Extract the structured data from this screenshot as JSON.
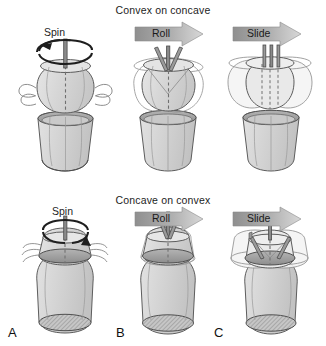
{
  "figure": {
    "kind": "arthrokinematics-diagram",
    "width": 326,
    "height": 346,
    "rows": [
      {
        "id": "convex-on-concave",
        "title": "Convex on concave",
        "panels": [
          {
            "letter": "A",
            "motion": "Spin",
            "motion_type": "rotation-arrow"
          },
          {
            "letter": "B",
            "motion": "Roll",
            "motion_type": "block-arrow-right"
          },
          {
            "letter": "C",
            "motion": "Slide",
            "motion_type": "block-arrow-right"
          }
        ]
      },
      {
        "id": "concave-on-convex",
        "title": "Concave on convex",
        "panels": [
          {
            "letter": "A",
            "motion": "Spin",
            "motion_type": "rotation-arrow"
          },
          {
            "letter": "B",
            "motion": "Roll",
            "motion_type": "block-arrow-right"
          },
          {
            "letter": "C",
            "motion": "Slide",
            "motion_type": "block-arrow-right"
          }
        ]
      }
    ],
    "panel_letters": [
      "A",
      "B",
      "C"
    ],
    "labels": {
      "title_top": "Convex on concave",
      "title_bottom": "Concave on convex",
      "spin_top": "Spin",
      "roll_top": "Roll",
      "slide_top": "Slide",
      "spin_bottom": "Spin",
      "roll_bottom": "Roll",
      "slide_bottom": "Slide",
      "letter_a": "A",
      "letter_b": "B",
      "letter_c": "C"
    },
    "colors": {
      "background": "#ffffff",
      "body_fill": "#d9d9d9",
      "body_fill_light": "#e4e4e4",
      "ghost_fill": "#f2f2f2",
      "outline": "#5a5a5a",
      "outline_dark": "#333333",
      "rim_fill": "#a8a8a8",
      "rim_dark": "#8f8f8f",
      "hatch": "#9a9a9a",
      "arrow_dark": "#8c8c8c",
      "arrow_light": "#d2d2d2",
      "text": "#1a1a1a",
      "axis_line": "#6e6e6e"
    }
  }
}
